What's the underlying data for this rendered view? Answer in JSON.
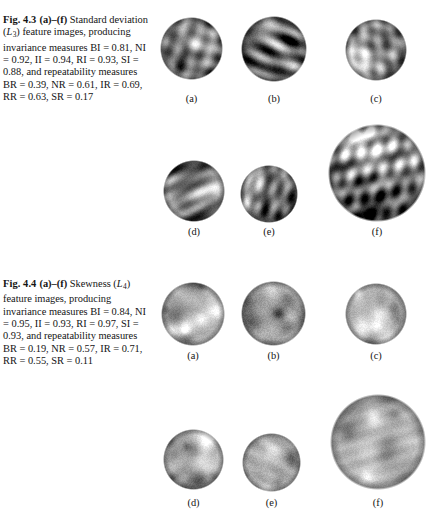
{
  "page": {
    "width": 432,
    "height": 521,
    "background": "#ffffff",
    "text_color": "#141414"
  },
  "figures": [
    {
      "id": "fig-4-3",
      "caption": {
        "fig_number": "Fig. 4.3",
        "panel_range": "(a)–(f)",
        "lines": [
          "Standard",
          "deviation (L3) feature",
          "images, producing invariance",
          "measures BI = 0.81,",
          "NI = 0.92, II = 0.94,",
          "RI = 0.93, SI = 0.88, and",
          "repeatability measures",
          "BR = 0.39, NR = 0.61,",
          "IR = 0.69, RR = 0.63,",
          "SR = 0.17"
        ],
        "feature_symbol": "L",
        "feature_subscript": "3",
        "feature_name": "Standard deviation",
        "invariance_measures": {
          "BI": "0.81",
          "NI": "0.92",
          "II": "0.94",
          "RI": "0.93",
          "SI": "0.88"
        },
        "repeatability_measures": {
          "BR": "0.39",
          "NR": "0.61",
          "IR": "0.69",
          "RR": "0.63",
          "SR": "0.17"
        }
      },
      "panels": [
        {
          "label": "(a)",
          "x": 160,
          "y": 17,
          "size": 63,
          "style": "ridged",
          "seed": 11,
          "brightness": 0.5,
          "contrast": 1.0
        },
        {
          "label": "(b)",
          "x": 241,
          "y": 16,
          "size": 66,
          "style": "ridged",
          "seed": 23,
          "brightness": 0.46,
          "contrast": 1.12
        },
        {
          "label": "(c)",
          "x": 345,
          "y": 19,
          "size": 62,
          "style": "ridged",
          "seed": 37,
          "brightness": 0.52,
          "contrast": 0.95
        },
        {
          "label": "(d)",
          "x": 163,
          "y": 160,
          "size": 62,
          "style": "ridged",
          "seed": 51,
          "brightness": 0.51,
          "contrast": 0.98
        },
        {
          "label": "(e)",
          "x": 240,
          "y": 165,
          "size": 58,
          "style": "ridged",
          "seed": 67,
          "brightness": 0.48,
          "contrast": 1.08
        },
        {
          "label": "(f)",
          "x": 328,
          "y": 124,
          "size": 98,
          "style": "ridged",
          "seed": 83,
          "brightness": 0.52,
          "contrast": 1.02
        }
      ],
      "panel_label_rows": [
        {
          "y": 93
        },
        {
          "y": 226
        }
      ]
    },
    {
      "id": "fig-4-4",
      "caption": {
        "fig_number": "Fig. 4.4",
        "panel_range": "(a)–(f)",
        "lines": [
          "Skewness",
          "(L4) feature images,",
          "producing invariance",
          "measures BI = 0.84,",
          "NI = 0.95, II = 0.93,",
          "RI = 0.97, SI = 0.93, and",
          "repeatability measures",
          "BR = 0.19, NR = 0.57,",
          "IR = 0.71, RR = 0.55,",
          "SR = 0.11"
        ],
        "feature_symbol": "L",
        "feature_subscript": "4",
        "feature_name": "Skewness",
        "invariance_measures": {
          "BI": "0.84",
          "NI": "0.95",
          "II": "0.93",
          "RI": "0.97",
          "SI": "0.93"
        },
        "repeatability_measures": {
          "BR": "0.19",
          "NR": "0.57",
          "IR": "0.71",
          "RR": "0.55",
          "SR": "0.11"
        }
      },
      "panels": [
        {
          "label": "(a)",
          "x": 161,
          "y": 282,
          "size": 64,
          "style": "blobby",
          "seed": 101,
          "brightness": 0.7,
          "contrast": 0.92
        },
        {
          "label": "(b)",
          "x": 241,
          "y": 281,
          "size": 65,
          "style": "blobby",
          "seed": 113,
          "brightness": 0.64,
          "contrast": 1.1
        },
        {
          "label": "(c)",
          "x": 345,
          "y": 283,
          "size": 62,
          "style": "blobby",
          "seed": 127,
          "brightness": 0.69,
          "contrast": 0.95
        },
        {
          "label": "(d)",
          "x": 163,
          "y": 429,
          "size": 61,
          "style": "blobby",
          "seed": 139,
          "brightness": 0.7,
          "contrast": 0.94
        },
        {
          "label": "(e)",
          "x": 242,
          "y": 433,
          "size": 59,
          "style": "blobby",
          "seed": 151,
          "brightness": 0.67,
          "contrast": 1.04
        },
        {
          "label": "(f)",
          "x": 330,
          "y": 394,
          "size": 96,
          "style": "blobby",
          "seed": 163,
          "brightness": 0.71,
          "contrast": 0.9
        }
      ],
      "panel_label_rows": [
        {
          "y": 350
        },
        {
          "y": 497
        }
      ]
    }
  ]
}
